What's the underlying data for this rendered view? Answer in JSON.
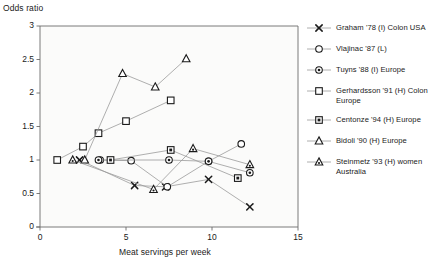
{
  "chart_data": {
    "type": "scatter",
    "title": "",
    "ylabel": "Odds ratio",
    "xlabel": "Meat servings per week",
    "xlim": [
      0,
      15
    ],
    "ylim": [
      0,
      3
    ],
    "xticks": [
      "0",
      "5",
      "10",
      "15"
    ],
    "yticks": [
      "0",
      "0.5",
      "1",
      "1.5",
      "2",
      "2.5",
      "3"
    ],
    "grid": false,
    "legend_position": "right",
    "series": [
      {
        "name": "Graham '78 (I) Colon USA",
        "marker": "cross-x",
        "x": [
          2.3,
          5.5,
          7.3,
          9.8,
          12.2
        ],
        "y": [
          1.0,
          0.62,
          0.6,
          0.71,
          0.3
        ]
      },
      {
        "name": "Vlajinac '87 (L)",
        "marker": "open-circle",
        "x": [
          3.5,
          5.3,
          7.4,
          9.8,
          11.7
        ],
        "y": [
          1.0,
          0.99,
          0.6,
          0.98,
          1.24
        ]
      },
      {
        "name": "Tuyns '88 (I) Europe",
        "marker": "dot-circle",
        "x": [
          3.4,
          7.5,
          9.8,
          12.2
        ],
        "y": [
          1.0,
          1.0,
          0.98,
          0.81
        ]
      },
      {
        "name": "Gerhardsson '91 (H) Colon Europe",
        "marker": "open-square",
        "x": [
          1.0,
          2.5,
          3.4,
          5.0,
          7.6
        ],
        "y": [
          1.0,
          1.2,
          1.4,
          1.58,
          1.89
        ]
      },
      {
        "name": "Centonze '94 (H) Europe",
        "marker": "dot-square",
        "x": [
          4.1,
          7.6,
          11.5
        ],
        "y": [
          1.0,
          1.15,
          0.73
        ]
      },
      {
        "name": "Bidoli '90 (H) Europe",
        "marker": "open-triangle",
        "x": [
          2.6,
          4.8,
          6.7,
          8.5
        ],
        "y": [
          1.0,
          2.29,
          2.09,
          2.51
        ]
      },
      {
        "name": "Steinmetz '93 (H) women Australia",
        "marker": "dot-triangle",
        "x": [
          1.9,
          6.6,
          8.9,
          12.2
        ],
        "y": [
          1.0,
          0.56,
          1.17,
          0.93
        ]
      }
    ]
  },
  "legend": {
    "items": [
      {
        "label": "Graham '78 (I) Colon USA",
        "marker": "cross-x"
      },
      {
        "label": "Vlajinac '87 (L)",
        "marker": "open-circle"
      },
      {
        "label": "Tuyns '88 (I) Europe",
        "marker": "dot-circle"
      },
      {
        "label": "Gerhardsson '91 (H) Colon Europe",
        "marker": "open-square"
      },
      {
        "label": "Centonze '94 (H) Europe",
        "marker": "dot-square"
      },
      {
        "label": "Bidoli '90 (H) Europe",
        "marker": "open-triangle"
      },
      {
        "label": "Steinmetz '93 (H) women Australia",
        "marker": "dot-triangle"
      }
    ]
  },
  "colors": {
    "axis": "#6b6b6b",
    "marker": "#1a1a1a",
    "connector": "#9a9a9a",
    "text": "#1a1a1a",
    "background": "#ffffff"
  }
}
